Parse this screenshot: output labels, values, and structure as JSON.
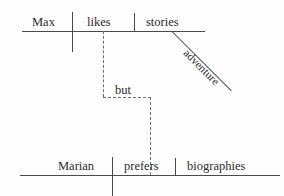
{
  "diagram": {
    "type": "reed-kellogg-sentence-diagram",
    "background_color": "#fefefe",
    "line_color": "#4a4a4a",
    "dashed_line_color": "#6d6d6d",
    "text_color": "#2b2b2b",
    "clauses": [
      {
        "id": "top-clause",
        "subject": "Max",
        "verb": "likes",
        "object": "stories",
        "modifier": "adventure"
      },
      {
        "id": "bottom-clause",
        "subject": "Marian",
        "verb": "prefers",
        "object": "biographies"
      }
    ],
    "conjunction": "but"
  }
}
